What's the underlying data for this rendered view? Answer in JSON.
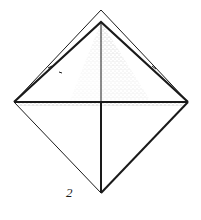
{
  "diagram": {
    "type": "origami-fold-step",
    "step_number": "2",
    "colors": {
      "line": "#1a1a1a",
      "background": "#ffffff",
      "shading": "#555555"
    },
    "points": {
      "outer_apex": [
        101,
        10
      ],
      "inner_apex": [
        101,
        22
      ],
      "left_corner": [
        14,
        102
      ],
      "right_corner": [
        188,
        102
      ],
      "bottom": [
        101,
        193
      ]
    }
  }
}
